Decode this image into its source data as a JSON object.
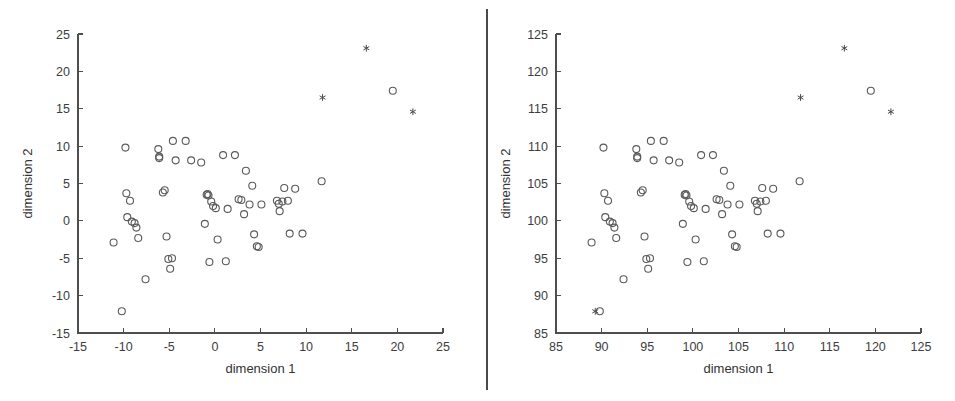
{
  "figure": {
    "width": 955,
    "height": 401,
    "background": "#ffffff",
    "divider_color": "#4a4a4a",
    "marker_circle_color": "#5a5a5a",
    "marker_star_color": "#4a4a4a",
    "axis_color": "#4e4e4e"
  },
  "chart_data": [
    {
      "type": "scatter",
      "title": "",
      "panel": "left",
      "xlabel": "dimension 1",
      "ylabel": "dimension 2",
      "xlim": [
        -15,
        25
      ],
      "ylim": [
        -15,
        25
      ],
      "xticks": [
        -15,
        -10,
        -5,
        0,
        5,
        10,
        15,
        20,
        25
      ],
      "xticklabels": [
        "-15",
        "-10",
        "-5",
        "0",
        "5",
        "10",
        "15",
        "20",
        "25"
      ],
      "yticks": [
        -15,
        -10,
        -5,
        0,
        5,
        10,
        15,
        20,
        25
      ],
      "yticklabels": [
        "-15",
        "-10",
        "-5",
        "0",
        "5",
        "10",
        "15",
        "20",
        "25"
      ],
      "grid": false,
      "legend": false,
      "series": [
        {
          "name": "inliers",
          "marker": "circle",
          "points": [
            [
              -11.1,
              -2.9
            ],
            [
              -10.2,
              -12.1
            ],
            [
              -9.8,
              9.8
            ],
            [
              -9.7,
              3.7
            ],
            [
              -9.6,
              0.5
            ],
            [
              -9.3,
              2.7
            ],
            [
              -9.1,
              -0.1
            ],
            [
              -8.8,
              -0.3
            ],
            [
              -8.6,
              -0.9
            ],
            [
              -8.4,
              -2.3
            ],
            [
              -7.6,
              -7.8
            ],
            [
              -6.2,
              9.6
            ],
            [
              -6.1,
              8.6
            ],
            [
              -6.1,
              8.4
            ],
            [
              -5.7,
              3.8
            ],
            [
              -5.5,
              4.1
            ],
            [
              -5.3,
              -2.1
            ],
            [
              -5.1,
              -5.1
            ],
            [
              -4.9,
              -6.4
            ],
            [
              -4.7,
              -5.0
            ],
            [
              -4.6,
              10.7
            ],
            [
              -4.3,
              8.1
            ],
            [
              -3.2,
              10.7
            ],
            [
              -2.6,
              8.1
            ],
            [
              -1.5,
              7.8
            ],
            [
              -1.1,
              -0.4
            ],
            [
              -0.9,
              3.5
            ],
            [
              -0.8,
              3.6
            ],
            [
              -0.7,
              3.4
            ],
            [
              -0.6,
              -5.5
            ],
            [
              -0.4,
              2.6
            ],
            [
              -0.2,
              2.0
            ],
            [
              0.1,
              1.7
            ],
            [
              0.3,
              -2.5
            ],
            [
              0.9,
              8.8
            ],
            [
              1.2,
              -5.4
            ],
            [
              1.4,
              1.6
            ],
            [
              2.2,
              8.8
            ],
            [
              2.6,
              2.9
            ],
            [
              2.9,
              2.8
            ],
            [
              3.2,
              0.9
            ],
            [
              3.4,
              6.7
            ],
            [
              3.8,
              2.2
            ],
            [
              4.1,
              4.7
            ],
            [
              4.3,
              -1.8
            ],
            [
              4.6,
              -3.4
            ],
            [
              4.8,
              -3.5
            ],
            [
              5.1,
              2.2
            ],
            [
              6.8,
              2.7
            ],
            [
              7.0,
              2.3
            ],
            [
              7.1,
              1.3
            ],
            [
              7.4,
              2.6
            ],
            [
              7.6,
              4.4
            ],
            [
              8.0,
              2.7
            ],
            [
              8.2,
              -1.7
            ],
            [
              8.8,
              4.3
            ],
            [
              9.6,
              -1.7
            ],
            [
              11.7,
              5.3
            ],
            [
              19.5,
              17.4
            ]
          ]
        },
        {
          "name": "outliers",
          "marker": "star",
          "points": [
            [
              11.8,
              16.5
            ],
            [
              16.6,
              23.1
            ],
            [
              21.7,
              14.6
            ]
          ]
        }
      ]
    },
    {
      "type": "scatter",
      "title": "",
      "panel": "right",
      "xlabel": "dimension 1",
      "ylabel": "dimension 2",
      "xlim": [
        85,
        125
      ],
      "ylim": [
        85,
        125
      ],
      "xticks": [
        85,
        90,
        95,
        100,
        105,
        110,
        115,
        120,
        125
      ],
      "xticklabels": [
        "85",
        "90",
        "95",
        "100",
        "105",
        "110",
        "115",
        "120",
        "125"
      ],
      "yticks": [
        85,
        90,
        95,
        100,
        105,
        110,
        115,
        120,
        125
      ],
      "yticklabels": [
        "85",
        "90",
        "95",
        "100",
        "105",
        "110",
        "115",
        "120",
        "125"
      ],
      "grid": false,
      "legend": false,
      "series": [
        {
          "name": "inliers",
          "marker": "circle",
          "points": [
            [
              88.9,
              97.1
            ],
            [
              89.8,
              87.9
            ],
            [
              90.2,
              109.8
            ],
            [
              90.3,
              103.7
            ],
            [
              90.4,
              100.5
            ],
            [
              90.7,
              102.7
            ],
            [
              90.9,
              99.9
            ],
            [
              91.2,
              99.7
            ],
            [
              91.4,
              99.1
            ],
            [
              91.6,
              97.7
            ],
            [
              92.4,
              92.2
            ],
            [
              93.8,
              109.6
            ],
            [
              93.9,
              108.6
            ],
            [
              93.9,
              108.4
            ],
            [
              94.3,
              103.8
            ],
            [
              94.5,
              104.1
            ],
            [
              94.7,
              97.9
            ],
            [
              94.9,
              94.9
            ],
            [
              95.1,
              93.6
            ],
            [
              95.3,
              95.0
            ],
            [
              95.4,
              110.7
            ],
            [
              95.7,
              108.1
            ],
            [
              96.8,
              110.7
            ],
            [
              97.4,
              108.1
            ],
            [
              98.5,
              107.8
            ],
            [
              98.9,
              99.6
            ],
            [
              99.1,
              103.5
            ],
            [
              99.2,
              103.6
            ],
            [
              99.3,
              103.4
            ],
            [
              99.4,
              94.5
            ],
            [
              99.6,
              102.6
            ],
            [
              99.8,
              102.0
            ],
            [
              100.1,
              101.7
            ],
            [
              100.3,
              97.5
            ],
            [
              100.9,
              108.8
            ],
            [
              101.2,
              94.6
            ],
            [
              101.4,
              101.6
            ],
            [
              102.2,
              108.8
            ],
            [
              102.6,
              102.9
            ],
            [
              102.9,
              102.8
            ],
            [
              103.2,
              100.9
            ],
            [
              103.4,
              106.7
            ],
            [
              103.8,
              102.2
            ],
            [
              104.1,
              104.7
            ],
            [
              104.3,
              98.2
            ],
            [
              104.6,
              96.6
            ],
            [
              104.8,
              96.5
            ],
            [
              105.1,
              102.2
            ],
            [
              106.8,
              102.7
            ],
            [
              107.0,
              102.3
            ],
            [
              107.1,
              101.3
            ],
            [
              107.4,
              102.6
            ],
            [
              107.6,
              104.4
            ],
            [
              108.0,
              102.7
            ],
            [
              108.2,
              98.3
            ],
            [
              108.8,
              104.3
            ],
            [
              109.6,
              98.3
            ],
            [
              111.7,
              105.3
            ],
            [
              119.5,
              117.4
            ]
          ]
        },
        {
          "name": "outliers",
          "marker": "star",
          "points": [
            [
              89.3,
              87.9
            ],
            [
              111.8,
              116.5
            ],
            [
              116.6,
              123.1
            ],
            [
              121.7,
              114.6
            ]
          ]
        }
      ]
    }
  ]
}
